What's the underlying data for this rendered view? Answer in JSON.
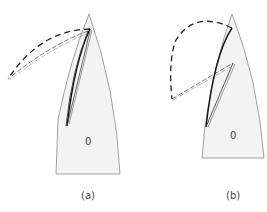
{
  "panels": [
    {
      "id": "a",
      "caption": "(a)",
      "center_label": "0"
    },
    {
      "id": "b",
      "caption": "(b)",
      "center_label": "0"
    }
  ],
  "colors": {
    "region_fill": "#f2f2f2",
    "region_stroke": "#888888",
    "line": "#222222",
    "double_line": "#555555",
    "background": "#ffffff"
  }
}
